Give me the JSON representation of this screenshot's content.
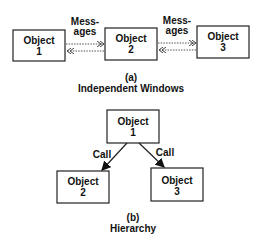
{
  "diagram_a": {
    "objects": [
      {
        "name": "Object",
        "num": "1"
      },
      {
        "name": "Object",
        "num": "2"
      },
      {
        "name": "Object",
        "num": "3"
      }
    ],
    "messages_label_line1": "Mess-",
    "messages_label_line2": "ages",
    "caption_letter": "(a)",
    "caption_title": "Independent  Windows"
  },
  "diagram_b": {
    "objects": [
      {
        "name": "Object",
        "num": "1"
      },
      {
        "name": "Object",
        "num": "2"
      },
      {
        "name": "Object",
        "num": "3"
      }
    ],
    "call_label": "Call",
    "caption_letter": "(b)",
    "caption_title": "Hierarchy"
  }
}
